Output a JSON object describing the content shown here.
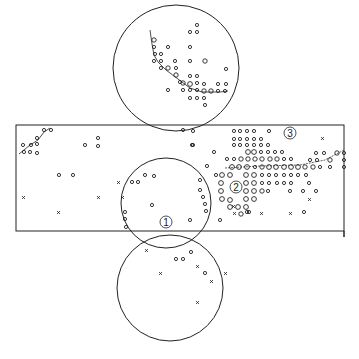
{
  "diagram": {
    "type": "stereographic-projection-net",
    "stroke_color": "#222222",
    "background": "#ffffff",
    "labels": [
      {
        "id": "1",
        "text": "①",
        "x": 166,
        "y": 225
      },
      {
        "id": "2",
        "text": "②",
        "x": 236,
        "y": 187
      },
      {
        "id": "3",
        "text": "③",
        "x": 290,
        "y": 136
      }
    ],
    "rectangle": {
      "x": 16,
      "y": 125,
      "width": 328,
      "height": 106
    },
    "circles": [
      {
        "name": "top-circle",
        "cx": 176,
        "cy": 68,
        "r": 63
      },
      {
        "name": "middle-circle",
        "cx": 166,
        "cy": 203,
        "r": 45
      },
      {
        "name": "bottom-circle",
        "cx": 170,
        "cy": 288,
        "r": 53
      }
    ],
    "marker_legend": [
      {
        "symbol": "o",
        "meaning": "small circle marker"
      },
      {
        "symbol": "O",
        "meaning": "large circle marker"
      },
      {
        "symbol": "x",
        "meaning": "cross marker"
      }
    ]
  }
}
